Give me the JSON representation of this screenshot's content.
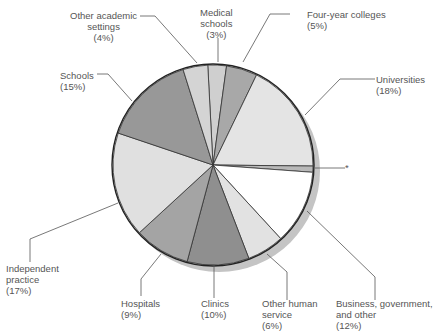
{
  "chart_data": {
    "type": "pie",
    "title": "",
    "slices": [
      {
        "label": "Medical schools",
        "value": 3,
        "color": "#cfcfcf"
      },
      {
        "label": "Four-year colleges",
        "value": 5,
        "color": "#a8a8a8"
      },
      {
        "label": "Universities",
        "value": 18,
        "color": "#e4e4e4"
      },
      {
        "label": "*",
        "value": 1,
        "color": "#b8b8b8"
      },
      {
        "label": "Business, government, and other",
        "value": 12,
        "color": "#ffffff"
      },
      {
        "label": "Other human service",
        "value": 6,
        "color": "#e2e2e2"
      },
      {
        "label": "Clinics",
        "value": 10,
        "color": "#8f8f8f"
      },
      {
        "label": "Hospitals",
        "value": 9,
        "color": "#a4a4a4"
      },
      {
        "label": "Independent practice",
        "value": 17,
        "color": "#e0e0e0"
      },
      {
        "label": "Schools",
        "value": 15,
        "color": "#989898"
      },
      {
        "label": "Other academic settings",
        "value": 4,
        "color": "#d4d4d4"
      }
    ],
    "legend": "none (callout labels)"
  },
  "labels": {
    "other_academic": {
      "l1": "Other academic",
      "l2": "settings",
      "l3": "(4%)"
    },
    "medical": {
      "l1": "Medical",
      "l2": "schools",
      "l3": "(3%)"
    },
    "four_year": {
      "l1": "Four-year colleges",
      "l2": "(5%)"
    },
    "universities": {
      "l1": "Universities",
      "l2": "(18%)"
    },
    "asterisk": {
      "l1": "*"
    },
    "schools": {
      "l1": "Schools",
      "l2": "(15%)"
    },
    "independent": {
      "l1": "Independent",
      "l2": "practice",
      "l3": "(17%)"
    },
    "hospitals": {
      "l1": "Hospitals",
      "l2": "(9%)"
    },
    "clinics": {
      "l1": "Clinics",
      "l2": "(10%)"
    },
    "other_human": {
      "l1": "Other human",
      "l2": "service",
      "l3": "(6%)"
    },
    "business": {
      "l1": "Business, government,",
      "l2": "and other",
      "l3": "(12%)"
    }
  }
}
